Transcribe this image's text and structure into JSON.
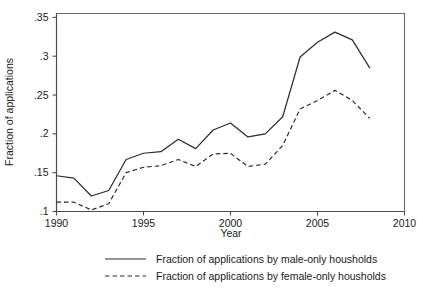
{
  "chart_data": {
    "type": "line",
    "title": "",
    "xlabel": "Year",
    "ylabel": "Fraction of applications",
    "xlim": [
      1990,
      2010
    ],
    "ylim": [
      0.1,
      0.355
    ],
    "grid": false,
    "legend_position": "bottom",
    "x": [
      1990,
      1991,
      1992,
      1993,
      1994,
      1995,
      1996,
      1997,
      1998,
      1999,
      2000,
      2001,
      2002,
      2003,
      2004,
      2005,
      2006,
      2007,
      2008
    ],
    "xticks": [
      "1990",
      "1995",
      "2000",
      "2005",
      "2010"
    ],
    "xtick_values": [
      1990,
      1995,
      2000,
      2005,
      2010
    ],
    "yticks": [
      ".1",
      ".15",
      ".2",
      ".25",
      ".3",
      ".35"
    ],
    "ytick_values": [
      0.1,
      0.15,
      0.2,
      0.25,
      0.3,
      0.35
    ],
    "series": [
      {
        "name": "Fraction of applications by male-only housholds",
        "style": "solid",
        "color": "#2b2b2b",
        "values": [
          0.146,
          0.143,
          0.12,
          0.127,
          0.167,
          0.175,
          0.177,
          0.193,
          0.181,
          0.205,
          0.214,
          0.196,
          0.2,
          0.222,
          0.299,
          0.318,
          0.331,
          0.321,
          0.285
        ]
      },
      {
        "name": "Fraction of applications by female-only housholds",
        "style": "dashed",
        "color": "#2b2b2b",
        "values": [
          0.112,
          0.112,
          0.102,
          0.11,
          0.15,
          0.157,
          0.159,
          0.167,
          0.158,
          0.174,
          0.175,
          0.158,
          0.161,
          0.185,
          0.232,
          0.243,
          0.256,
          0.243,
          0.22
        ]
      }
    ]
  },
  "legend": {
    "entries": [
      {
        "label": "Fraction of applications by male-only housholds",
        "style": "solid"
      },
      {
        "label": "Fraction of applications by female-only housholds",
        "style": "dashed"
      }
    ]
  }
}
